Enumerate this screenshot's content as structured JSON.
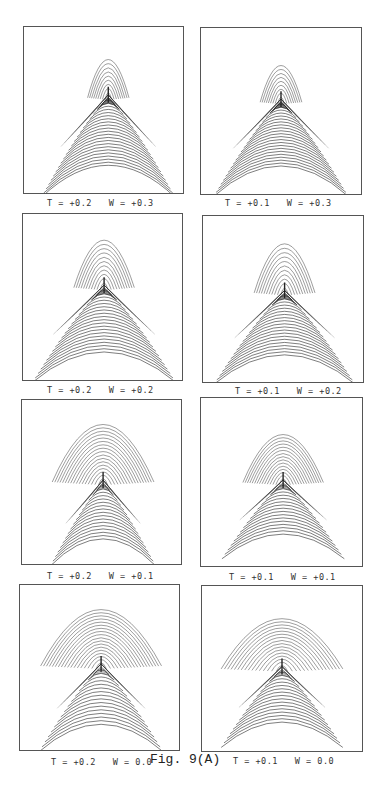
{
  "figure": {
    "caption": "Fig. 9(A)",
    "panels": [
      {
        "id": "p1",
        "label": "T = +0.2   W = +0.3",
        "T": 0.2,
        "W": 0.3,
        "frame": {
          "x": 23,
          "y": 26,
          "w": 161,
          "h": 168
        },
        "label_pos": {
          "x": 47,
          "y": 198
        },
        "shape": {
          "cx": 0.53,
          "cusp": 0.42,
          "upper_top": 0.19,
          "upper_half_w": 0.13,
          "upper_n": 9,
          "lower_bottom": 0.98,
          "lower_half_w": 0.42,
          "lower_n": 22,
          "lower_dense": 12
        }
      },
      {
        "id": "p2",
        "label": "T = +0.1   W = +0.3",
        "T": 0.1,
        "W": 0.3,
        "frame": {
          "x": 200,
          "y": 27,
          "w": 162,
          "h": 168
        },
        "label_pos": {
          "x": 225,
          "y": 198
        },
        "shape": {
          "cx": 0.5,
          "cusp": 0.44,
          "upper_top": 0.22,
          "upper_half_w": 0.13,
          "upper_n": 9,
          "lower_bottom": 0.97,
          "lower_half_w": 0.42,
          "lower_n": 22,
          "lower_dense": 12
        }
      },
      {
        "id": "p3",
        "label": "T = +0.2   W = +0.2",
        "T": 0.2,
        "W": 0.2,
        "frame": {
          "x": 22,
          "y": 213,
          "w": 161,
          "h": 168
        },
        "label_pos": {
          "x": 47,
          "y": 385
        },
        "shape": {
          "cx": 0.51,
          "cusp": 0.44,
          "upper_top": 0.15,
          "upper_half_w": 0.19,
          "upper_n": 11,
          "lower_bottom": 0.97,
          "lower_half_w": 0.45,
          "lower_n": 20,
          "lower_dense": 10
        }
      },
      {
        "id": "p4",
        "label": "T = +0.1   W = +0.2",
        "T": 0.1,
        "W": 0.2,
        "frame": {
          "x": 202,
          "y": 215,
          "w": 162,
          "h": 168
        },
        "label_pos": {
          "x": 235,
          "y": 386
        },
        "shape": {
          "cx": 0.51,
          "cusp": 0.46,
          "upper_top": 0.16,
          "upper_half_w": 0.19,
          "upper_n": 11,
          "lower_bottom": 0.97,
          "lower_half_w": 0.44,
          "lower_n": 20,
          "lower_dense": 10
        }
      },
      {
        "id": "p5",
        "label": "T = +0.2   W = +0.1",
        "T": 0.2,
        "W": 0.1,
        "frame": {
          "x": 21,
          "y": 399,
          "w": 161,
          "h": 166
        },
        "label_pos": {
          "x": 47,
          "y": 571
        },
        "shape": {
          "cx": 0.51,
          "cusp": 0.5,
          "upper_top": 0.14,
          "upper_half_w": 0.32,
          "upper_n": 17,
          "lower_bottom": 0.97,
          "lower_half_w": 0.33,
          "lower_n": 17,
          "lower_dense": 6
        }
      },
      {
        "id": "p6",
        "label": "T = +0.1   W = +0.1",
        "T": 0.1,
        "W": 0.1,
        "frame": {
          "x": 200,
          "y": 397,
          "w": 163,
          "h": 170
        },
        "label_pos": {
          "x": 229,
          "y": 572
        },
        "shape": {
          "cx": 0.51,
          "cusp": 0.5,
          "upper_top": 0.21,
          "upper_half_w": 0.25,
          "upper_n": 15,
          "lower_bottom": 0.92,
          "lower_half_w": 0.38,
          "lower_n": 16,
          "lower_dense": 6
        }
      },
      {
        "id": "p7",
        "label": "T = +0.2   W = 0.0",
        "T": 0.2,
        "W": 0.0,
        "frame": {
          "x": 19,
          "y": 584,
          "w": 161,
          "h": 167
        },
        "label_pos": {
          "x": 51,
          "y": 757
        },
        "shape": {
          "cx": 0.51,
          "cusp": 0.49,
          "upper_top": 0.14,
          "upper_half_w": 0.38,
          "upper_n": 18,
          "lower_bottom": 0.97,
          "lower_half_w": 0.39,
          "lower_n": 16,
          "lower_dense": 5
        }
      },
      {
        "id": "p8",
        "label": "T = +0.1   W = 0.0",
        "T": 0.1,
        "W": 0.0,
        "frame": {
          "x": 201,
          "y": 585,
          "w": 162,
          "h": 167
        },
        "label_pos": {
          "x": 233,
          "y": 756
        },
        "shape": {
          "cx": 0.5,
          "cusp": 0.5,
          "upper_top": 0.19,
          "upper_half_w": 0.38,
          "upper_n": 16,
          "lower_bottom": 0.94,
          "lower_half_w": 0.38,
          "lower_n": 16,
          "lower_dense": 5
        }
      }
    ],
    "caption_pos": {
      "x": 150,
      "y": 752
    },
    "colors": {
      "ink": "#222222",
      "frame": "#555555",
      "background": "#ffffff"
    }
  }
}
